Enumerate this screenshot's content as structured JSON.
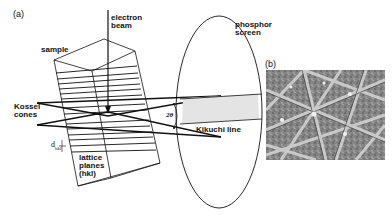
{
  "figure": {
    "panel_a": {
      "label": "(a)",
      "electron_beam": "electron\nbeam",
      "sample": "sample",
      "kossel_cones": "Kossel\ncones",
      "d_hkl_main": "d",
      "d_hkl_sub": "hkl",
      "lattice_planes": "lattice\nplanes\n(hkl)",
      "two_theta": "2θ",
      "phosphor_screen": "phosphor\nscreen",
      "kikuchi_line": "Kikuchi line"
    },
    "panel_b": {
      "label": "(b)",
      "description": "Kikuchi pattern (EBSD)"
    },
    "colors": {
      "line": "#111111",
      "band_fill": "#e4e4e4",
      "pattern_bg": "#8a8a8a"
    }
  }
}
